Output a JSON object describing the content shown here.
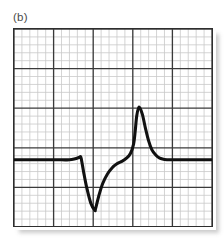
{
  "figure": {
    "panel_label": "(b)",
    "background_color": "#ffffff",
    "border_color": "#2e2e2e"
  },
  "grid": {
    "minor_color": "#c9c9c9",
    "major_color": "#3a3a3a",
    "minor_spacing_px": 8,
    "major_every_n_minor": 5,
    "minor_columns": 25,
    "minor_rows": 25,
    "major_columns": 5,
    "major_rows": 5
  },
  "chart_data": {
    "type": "line",
    "title": "(b)",
    "xlabel": "",
    "ylabel": "",
    "grid": true,
    "legend": "none",
    "series_color": "#111111",
    "xlim": [
      0,
      25
    ],
    "ylim": [
      -25,
      0
    ],
    "x": [
      0,
      2,
      4,
      6,
      7,
      7.6,
      8.2,
      8.4,
      8.5,
      8.8,
      9.2,
      9.7,
      10.2,
      10.3,
      10.7,
      11.2,
      11.8,
      12.4,
      13.0,
      13.6,
      14.2,
      14.7,
      15.1,
      15.3,
      15.5,
      15.8,
      16.2,
      16.6,
      17.0,
      17.4,
      17.9,
      18.4,
      19.0,
      19.8,
      21.0,
      23.0,
      25.0
    ],
    "y": [
      -16.6,
      -16.6,
      -16.6,
      -16.6,
      -16.6,
      -16.5,
      -16.3,
      -16.2,
      -16.5,
      -18.2,
      -20.2,
      -22.1,
      -23.0,
      -22.8,
      -21.2,
      -19.6,
      -18.4,
      -17.6,
      -17.1,
      -16.8,
      -16.4,
      -15.8,
      -14.6,
      -13.0,
      -11.0,
      -9.9,
      -10.8,
      -12.6,
      -14.2,
      -15.3,
      -16.0,
      -16.4,
      -16.55,
      -16.6,
      -16.6,
      -16.6,
      -16.6
    ],
    "annotations": [
      {
        "name": "baseline-left",
        "x_range": [
          0,
          8.2
        ],
        "y": -16.6
      },
      {
        "name": "negative-deflection-trough",
        "x": 10.2,
        "y": -23.0
      },
      {
        "name": "shoulder-inflection",
        "x": 12.4,
        "y": -17.6
      },
      {
        "name": "positive-peak",
        "x": 15.8,
        "y": -9.9
      },
      {
        "name": "baseline-right",
        "x_range": [
          19.0,
          25
        ],
        "y": -16.6
      }
    ]
  }
}
